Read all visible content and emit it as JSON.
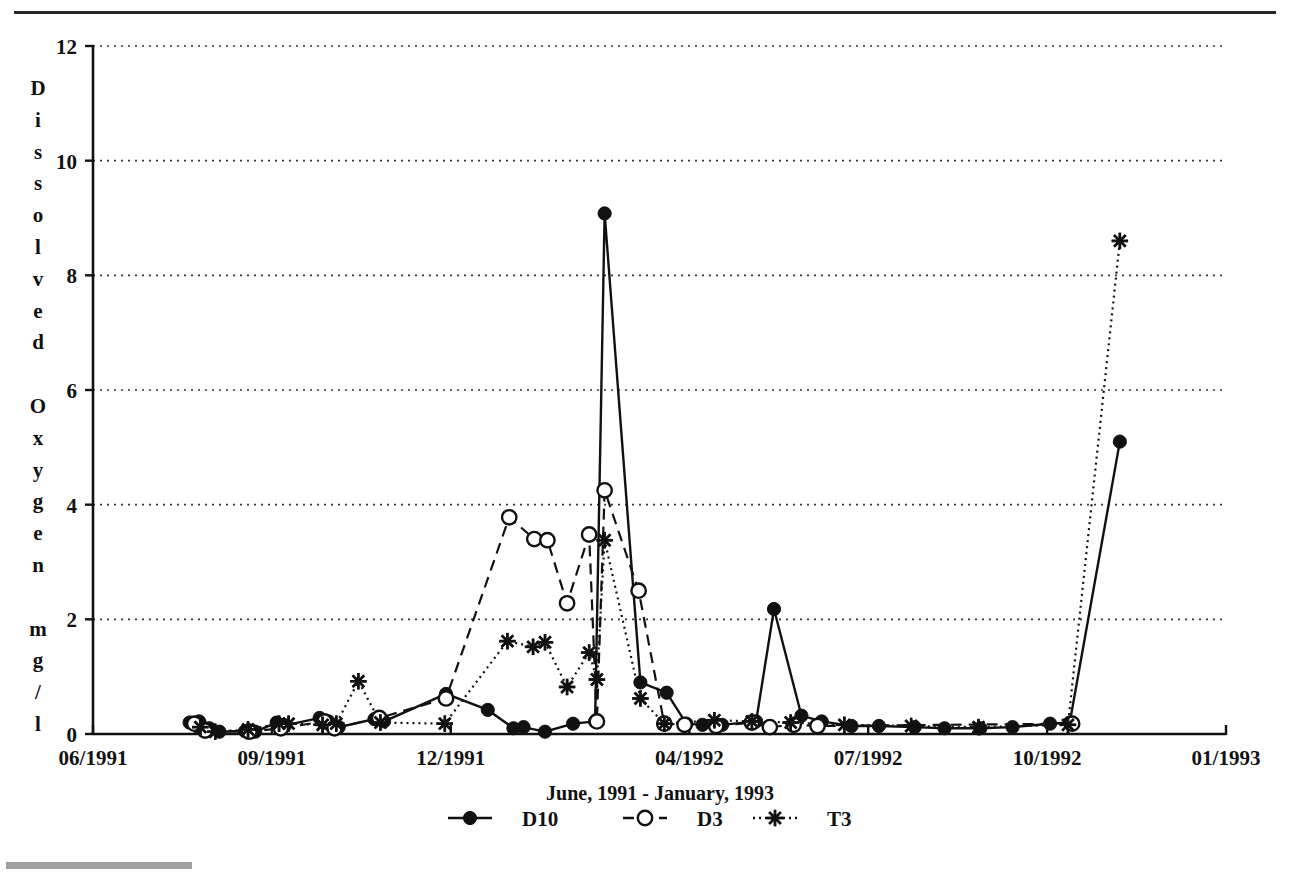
{
  "figure": {
    "background": "#ffffff",
    "ink_color": "#111111",
    "has_top_rule": true,
    "has_bottom_scan_smudge": true
  },
  "chart_data": {
    "type": "line",
    "title": "",
    "subtitle": "",
    "xlabel": "June, 1991 - January, 1993",
    "ylabel": "Dissolved Oxygen mg/l",
    "ylabel_stacked_chars": [
      "D",
      "i",
      "s",
      "s",
      "o",
      "l",
      "v",
      "e",
      "d",
      "",
      "O",
      "x",
      "y",
      "g",
      "e",
      "n",
      "",
      "m",
      "g",
      "/",
      "l"
    ],
    "ylim": [
      0,
      12
    ],
    "yticks": [
      0,
      2,
      4,
      6,
      8,
      10,
      12
    ],
    "ytick_labels": [
      "0",
      "2",
      "4",
      "6",
      "8",
      "10",
      "12"
    ],
    "xlim": [
      "06/1991",
      "01/1993"
    ],
    "xtick_labels": [
      "06/1991",
      "09/1991",
      "12/1991",
      "04/1992",
      "07/1992",
      "10/1992",
      "01/1993"
    ],
    "xtick_months": [
      0,
      3,
      6,
      10,
      13,
      16,
      19
    ],
    "grid": true,
    "grid_axis": "y",
    "grid_style": "dotted",
    "legend_position": "bottom",
    "x_unit": "months since 06/1991",
    "series": [
      {
        "name": "D10",
        "marker": "filled-circle",
        "line_style": "solid",
        "color": "#111111",
        "points": [
          [
            1.62,
            0.2
          ],
          [
            1.78,
            0.22
          ],
          [
            1.95,
            0.1
          ],
          [
            2.12,
            0.04
          ],
          [
            2.55,
            0.05
          ],
          [
            2.72,
            0.04
          ],
          [
            3.08,
            0.2
          ],
          [
            3.22,
            0.15
          ],
          [
            3.8,
            0.28
          ],
          [
            3.95,
            0.22
          ],
          [
            4.12,
            0.12
          ],
          [
            4.72,
            0.26
          ],
          [
            4.88,
            0.22
          ],
          [
            5.92,
            0.7
          ],
          [
            6.62,
            0.42
          ],
          [
            7.05,
            0.1
          ],
          [
            7.22,
            0.12
          ],
          [
            7.58,
            0.04
          ],
          [
            8.05,
            0.18
          ],
          [
            8.42,
            0.22
          ],
          [
            8.58,
            9.08
          ],
          [
            9.18,
            0.9
          ],
          [
            9.62,
            0.72
          ],
          [
            9.95,
            0.18
          ],
          [
            10.22,
            0.16
          ],
          [
            10.55,
            0.16
          ],
          [
            11.12,
            0.22
          ],
          [
            11.42,
            2.18
          ],
          [
            11.88,
            0.32
          ],
          [
            12.22,
            0.22
          ],
          [
            12.72,
            0.14
          ],
          [
            13.18,
            0.14
          ],
          [
            13.78,
            0.12
          ],
          [
            14.28,
            0.1
          ],
          [
            14.88,
            0.1
          ],
          [
            15.42,
            0.12
          ],
          [
            16.05,
            0.18
          ],
          [
            16.38,
            0.2
          ],
          [
            17.22,
            5.1
          ]
        ]
      },
      {
        "name": "D3",
        "marker": "open-circle",
        "line_style": "dashed",
        "color": "#111111",
        "points": [
          [
            1.7,
            0.18
          ],
          [
            1.88,
            0.06
          ],
          [
            2.62,
            0.04
          ],
          [
            3.15,
            0.1
          ],
          [
            3.88,
            0.22
          ],
          [
            4.05,
            0.1
          ],
          [
            4.8,
            0.28
          ],
          [
            5.92,
            0.62
          ],
          [
            6.98,
            3.78
          ],
          [
            7.4,
            3.4
          ],
          [
            7.62,
            3.38
          ],
          [
            7.95,
            2.28
          ],
          [
            8.32,
            3.48
          ],
          [
            8.45,
            0.22
          ],
          [
            8.58,
            4.25
          ],
          [
            9.15,
            2.5
          ],
          [
            9.58,
            0.18
          ],
          [
            9.92,
            0.16
          ],
          [
            10.45,
            0.14
          ],
          [
            11.05,
            0.2
          ],
          [
            11.35,
            0.12
          ],
          [
            11.75,
            0.16
          ],
          [
            12.15,
            0.14
          ],
          [
            16.42,
            0.18
          ]
        ]
      },
      {
        "name": "T3",
        "marker": "asterisk",
        "line_style": "dotted",
        "color": "#111111",
        "points": [
          [
            1.8,
            0.12
          ],
          [
            2.05,
            0.04
          ],
          [
            2.6,
            0.08
          ],
          [
            3.12,
            0.18
          ],
          [
            3.28,
            0.18
          ],
          [
            3.85,
            0.16
          ],
          [
            4.08,
            0.18
          ],
          [
            4.45,
            0.92
          ],
          [
            4.82,
            0.2
          ],
          [
            5.9,
            0.18
          ],
          [
            6.95,
            1.62
          ],
          [
            7.38,
            1.52
          ],
          [
            7.58,
            1.6
          ],
          [
            7.95,
            0.82
          ],
          [
            8.32,
            1.42
          ],
          [
            8.45,
            0.95
          ],
          [
            8.58,
            3.38
          ],
          [
            9.18,
            0.62
          ],
          [
            9.58,
            0.18
          ],
          [
            10.42,
            0.24
          ],
          [
            11.05,
            0.22
          ],
          [
            11.7,
            0.2
          ],
          [
            12.6,
            0.16
          ],
          [
            13.72,
            0.14
          ],
          [
            14.85,
            0.12
          ],
          [
            16.35,
            0.16
          ],
          [
            17.22,
            8.6
          ]
        ]
      }
    ],
    "annotations": [
      {
        "text": "D10 maximum",
        "x_months": 8.58,
        "value": 9.08
      },
      {
        "text": "T3 maximum",
        "x_months": 17.22,
        "value": 8.6
      },
      {
        "text": "D3 maximum",
        "x_months": 8.58,
        "value": 4.25
      }
    ]
  },
  "legend": {
    "entries": [
      {
        "label": "D10",
        "marker": "filled-circle",
        "line_style": "solid"
      },
      {
        "label": "D3",
        "marker": "open-circle",
        "line_style": "dashed"
      },
      {
        "label": "T3",
        "marker": "asterisk",
        "line_style": "dotted"
      }
    ]
  }
}
